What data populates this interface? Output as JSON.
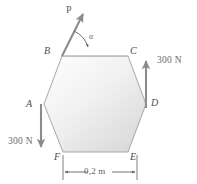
{
  "figure": {
    "shape": {
      "name": "regular-hexagon",
      "fill_light": "#fdfdfd",
      "fill_dark": "#dcdcdc",
      "stroke": "#9a9a9a"
    },
    "vertices": [
      {
        "id": "A",
        "label": "A",
        "x": 44,
        "y": 104,
        "label_x": 26,
        "label_y": 99
      },
      {
        "id": "B",
        "label": "B",
        "x": 62,
        "y": 56,
        "label_x": 44,
        "label_y": 47
      },
      {
        "id": "C",
        "label": "C",
        "x": 128,
        "y": 56,
        "label_x": 130,
        "label_y": 47
      },
      {
        "id": "D",
        "label": "D",
        "x": 146,
        "y": 104,
        "label_x": 151,
        "label_y": 98
      },
      {
        "id": "E",
        "label": "E",
        "x": 128,
        "y": 152,
        "label_x": 130,
        "label_y": 152
      },
      {
        "id": "F",
        "label": "F",
        "x": 63,
        "y": 152,
        "label_x": 54,
        "label_y": 152
      }
    ],
    "forces": [
      {
        "name": "force-p",
        "label": "P",
        "label_x": 66,
        "label_y": 5,
        "from": {
          "x": 62,
          "y": 56
        },
        "to": {
          "x": 83,
          "y": 13
        },
        "color": "#8c8c8c"
      },
      {
        "name": "force-left-300n",
        "label": "300 N",
        "label_x": 8,
        "label_y": 137,
        "from": {
          "x": 41,
          "y": 104
        },
        "to": {
          "x": 41,
          "y": 149
        },
        "color": "#8c8c8c"
      },
      {
        "name": "force-right-300n",
        "label": "300 N",
        "label_x": 157,
        "label_y": 56,
        "from": {
          "x": 146,
          "y": 108
        },
        "to": {
          "x": 146,
          "y": 59
        },
        "color": "#8c8c8c"
      }
    ],
    "angle": {
      "name": "angle-alpha",
      "label": "α",
      "label_x": 89,
      "label_y": 33,
      "vertex": {
        "x": 62,
        "y": 56
      }
    },
    "dimension": {
      "name": "dimension-width",
      "label": "0,2 m",
      "label_x": 84,
      "label_y": 167,
      "from_x": 63,
      "to_x": 137,
      "y": 172,
      "color": "#5d5d5d"
    },
    "baseline": {
      "name": "horizontal-reference-line",
      "from": {
        "x": 62,
        "y": 56
      },
      "to": {
        "x": 128,
        "y": 56
      }
    }
  }
}
